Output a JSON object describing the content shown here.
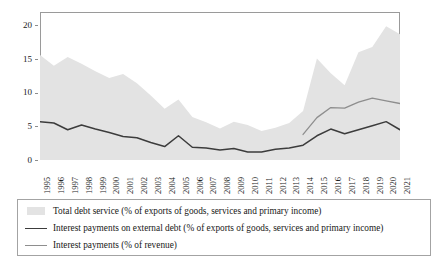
{
  "chart_data": {
    "type": "area",
    "title": "",
    "subtitle": "",
    "xlabel": "",
    "ylabel": "",
    "grid": false,
    "legend_position": "bottom",
    "xlim": [
      1995,
      2021
    ],
    "ylim": [
      0,
      22
    ],
    "y_ticks": [
      0,
      5,
      10,
      15,
      20
    ],
    "y_tick_labels": [
      "0",
      "5",
      "10",
      "15",
      "20"
    ],
    "categories": [
      "1995",
      "1996",
      "1997",
      "1998",
      "1999",
      "2000",
      "2001",
      "2002",
      "2003",
      "2004",
      "2005",
      "2006",
      "2007",
      "2008",
      "2009",
      "2010",
      "2011",
      "2012",
      "2013",
      "2014",
      "2015",
      "2016",
      "2017",
      "2018",
      "2019",
      "2020",
      "2021"
    ],
    "series": [
      {
        "name": "Total debt service (% of exports of goods, services and primary income)",
        "render": "area",
        "color": "#e3e3e3",
        "x": [
          1995,
          1996,
          1997,
          1998,
          1999,
          2000,
          2001,
          2002,
          2003,
          2004,
          2005,
          2006,
          2007,
          2008,
          2009,
          2010,
          2011,
          2012,
          2013,
          2014,
          2015,
          2016,
          2017,
          2018,
          2019,
          2020,
          2021
        ],
        "values": [
          15.6,
          14.0,
          15.3,
          14.3,
          13.2,
          12.2,
          12.8,
          11.4,
          9.6,
          7.6,
          9.0,
          6.4,
          5.6,
          4.7,
          5.7,
          5.2,
          4.3,
          4.8,
          5.5,
          7.3,
          15.1,
          12.9,
          11.1,
          16.0,
          16.8,
          19.9,
          18.7
        ]
      },
      {
        "name": "Interest payments on external debt (% of exports of goods, services and primary income)",
        "render": "line",
        "color": "#3c3c3c",
        "x": [
          1995,
          1996,
          1997,
          1998,
          1999,
          2000,
          2001,
          2002,
          2003,
          2004,
          2005,
          2006,
          2007,
          2008,
          2009,
          2010,
          2011,
          2012,
          2013,
          2014,
          2015,
          2016,
          2017,
          2018,
          2019,
          2020,
          2021
        ],
        "values": [
          5.7,
          5.5,
          4.5,
          5.2,
          4.6,
          4.1,
          3.5,
          3.3,
          2.6,
          2.0,
          3.6,
          1.9,
          1.8,
          1.5,
          1.7,
          1.2,
          1.2,
          1.6,
          1.8,
          2.2,
          3.6,
          4.6,
          3.9,
          4.5,
          5.1,
          5.7,
          4.5
        ]
      },
      {
        "name": "Interest payments (% of revenue)",
        "render": "line",
        "color": "#8e8e8e",
        "x": [
          2014,
          2015,
          2016,
          2017,
          2018,
          2019,
          2020,
          2021
        ],
        "values": [
          3.8,
          6.3,
          7.8,
          7.7,
          8.6,
          9.2,
          8.8,
          8.4
        ]
      }
    ]
  },
  "legend": {
    "items": [
      {
        "label": "Total debt service (% of exports of goods, services and primary income)",
        "marker": "area-swatch",
        "color": "#e3e3e3"
      },
      {
        "label": "Interest payments on external debt (% of exports of goods, services and primary income)",
        "marker": "line-swatch",
        "color": "#3c3c3c"
      },
      {
        "label": "Interest payments (% of revenue)",
        "marker": "line-swatch",
        "color": "#8e8e8e"
      }
    ]
  }
}
